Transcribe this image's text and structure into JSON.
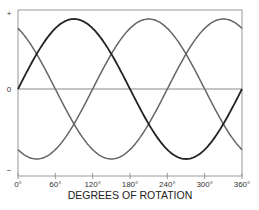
{
  "chart_data": {
    "type": "line",
    "title": "",
    "xlabel": "DEGREES OF ROTATION",
    "ylabel": "",
    "x_ticks": [
      "0°",
      "60°",
      "120°",
      "180°",
      "240°",
      "300°",
      "360°"
    ],
    "x_tick_values": [
      0,
      60,
      120,
      180,
      240,
      300,
      360
    ],
    "y_tick_labels": {
      "top": "+",
      "zero": "0",
      "bottom": "−"
    },
    "xlim": [
      0,
      360
    ],
    "ylim": [
      -1.1,
      1.1
    ],
    "grid": false,
    "legend": null,
    "series": [
      {
        "name": "Phase A",
        "function": "sin(θ)",
        "phase_deg": 0,
        "color": "#222222",
        "amplitude": 1,
        "x": [
          0,
          30,
          60,
          90,
          120,
          150,
          180,
          210,
          240,
          270,
          300,
          330,
          360
        ],
        "values": [
          0,
          0.5,
          0.866,
          1,
          0.866,
          0.5,
          0,
          -0.5,
          -0.866,
          -1,
          -0.866,
          -0.5,
          0
        ]
      },
      {
        "name": "Phase B",
        "function": "sin(θ+120°)",
        "phase_deg": 120,
        "color": "#666666",
        "amplitude": 1,
        "x": [
          0,
          30,
          60,
          90,
          120,
          150,
          180,
          210,
          240,
          270,
          300,
          330,
          360
        ],
        "values": [
          0.866,
          0.5,
          0,
          -0.5,
          -0.866,
          -1,
          -0.866,
          -0.5,
          0,
          0.5,
          0.866,
          1,
          0.866
        ]
      },
      {
        "name": "Phase C",
        "function": "sin(θ−120°)",
        "phase_deg": -120,
        "color": "#666666",
        "amplitude": 1,
        "x": [
          0,
          30,
          60,
          90,
          120,
          150,
          180,
          210,
          240,
          270,
          300,
          330,
          360
        ],
        "values": [
          -0.866,
          -1,
          -0.866,
          -0.5,
          0,
          0.5,
          0.866,
          1,
          0.866,
          0.5,
          0,
          -0.5,
          -0.866
        ]
      }
    ]
  },
  "layout": {
    "plot_left": 18,
    "plot_right": 242,
    "plot_top": 10,
    "plot_bottom": 176,
    "zero_y": 89,
    "amplitude_px": 70,
    "frame_color": "#9a9a9a",
    "zero_line_color": "#8a8a8a"
  }
}
